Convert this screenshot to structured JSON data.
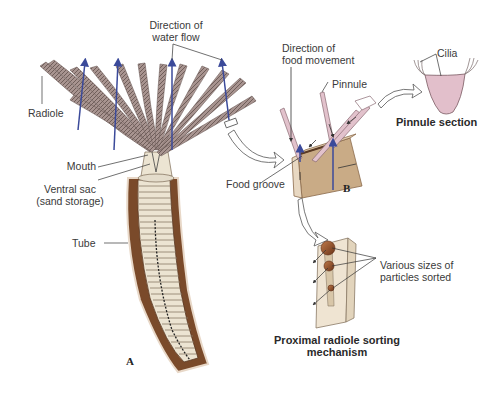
{
  "figure": {
    "panel_a": {
      "id_label": "A",
      "labels": {
        "water_flow": [
          "Direction of",
          "water flow"
        ],
        "radiole": "Radiole",
        "mouth": "Mouth",
        "ventral_sac": [
          "Ventral sac",
          "(sand storage)"
        ],
        "tube": "Tube"
      }
    },
    "panel_b": {
      "id_label": "B",
      "labels": {
        "food_movement": [
          "Direction of",
          "food movement"
        ],
        "pinnule": "Pinnule",
        "food_groove": "Food groove"
      }
    },
    "pinnule_section": {
      "title": "Pinnule section",
      "labels": {
        "cilia": "Cilia"
      }
    },
    "sorting": {
      "title": [
        "Proximal radiole sorting",
        "mechanism"
      ],
      "labels": {
        "particles": [
          "Various sizes of",
          "particles sorted"
        ]
      }
    },
    "colors": {
      "radiole": "#9a8a86",
      "water_arrow": "#3b4a9a",
      "tube_brown": "#7a4a2a",
      "body_cream": "#ece4d2",
      "groove_tan": "#c9ab86",
      "pinnule_pink": "#e2c2cc",
      "particle": "#8a4a26"
    }
  }
}
